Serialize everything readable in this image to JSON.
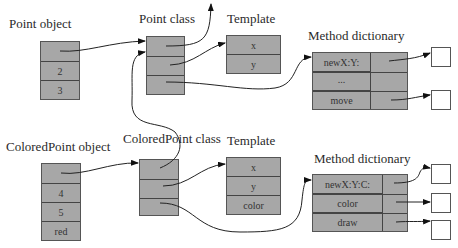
{
  "diagram": {
    "type": "object-class-memory-layout",
    "point_object": {
      "label": "Point object",
      "cells": [
        "",
        "2",
        "3"
      ]
    },
    "point_class": {
      "label": "Point class",
      "cells": [
        "",
        "",
        ""
      ]
    },
    "point_template": {
      "label": "Template",
      "cells": [
        "x",
        "y"
      ]
    },
    "point_method_dictionary": {
      "label": "Method dictionary",
      "rows": [
        {
          "selector": "newX:Y:",
          "has_code": true
        },
        {
          "selector": "...",
          "has_code": false
        },
        {
          "selector": "move",
          "has_code": true
        }
      ]
    },
    "colored_point_object": {
      "label": "ColoredPoint object",
      "cells": [
        "",
        "4",
        "5",
        "red"
      ]
    },
    "colored_point_class": {
      "label": "ColoredPoint class",
      "cells": [
        "",
        "",
        ""
      ]
    },
    "colored_point_template": {
      "label": "Template",
      "cells": [
        "x",
        "y",
        "color"
      ]
    },
    "colored_point_method_dictionary": {
      "label": "Method dictionary",
      "rows": [
        {
          "selector": "newX:Y:C:",
          "has_code": true
        },
        {
          "selector": "color",
          "has_code": true
        },
        {
          "selector": "draw",
          "has_code": true
        }
      ]
    },
    "edges": [
      {
        "from": "Point object.class-pointer",
        "to": "Point class"
      },
      {
        "from": "Point class.superclass",
        "to": "(up, off-diagram)"
      },
      {
        "from": "Point class.template",
        "to": "Template (x, y)"
      },
      {
        "from": "Point class.methods",
        "to": "Method dictionary (Point)"
      },
      {
        "from": "ColoredPoint object.class-pointer",
        "to": "ColoredPoint class"
      },
      {
        "from": "ColoredPoint class.superclass",
        "to": "Point class"
      },
      {
        "from": "ColoredPoint class.template",
        "to": "Template (x, y, color)"
      },
      {
        "from": "ColoredPoint class.methods",
        "to": "Method dictionary (ColoredPoint)"
      },
      {
        "from": "newX:Y:",
        "to": "code"
      },
      {
        "from": "move",
        "to": "code"
      },
      {
        "from": "newX:Y:C:",
        "to": "code"
      },
      {
        "from": "color",
        "to": "code"
      },
      {
        "from": "draw",
        "to": "code"
      }
    ],
    "colors": {
      "cell_fill": "#a7a7a7",
      "border": "#555555",
      "background": "#ffffff",
      "code_box": "#ffffff"
    }
  }
}
